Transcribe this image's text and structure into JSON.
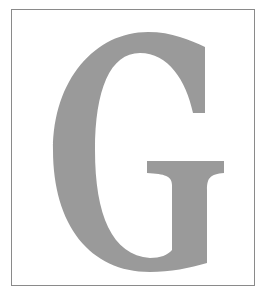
{
  "image": {
    "letter": "G",
    "colors": {
      "background": "#ffffff",
      "border": "#8a8a8a",
      "letter": "#9a9a9a"
    }
  }
}
